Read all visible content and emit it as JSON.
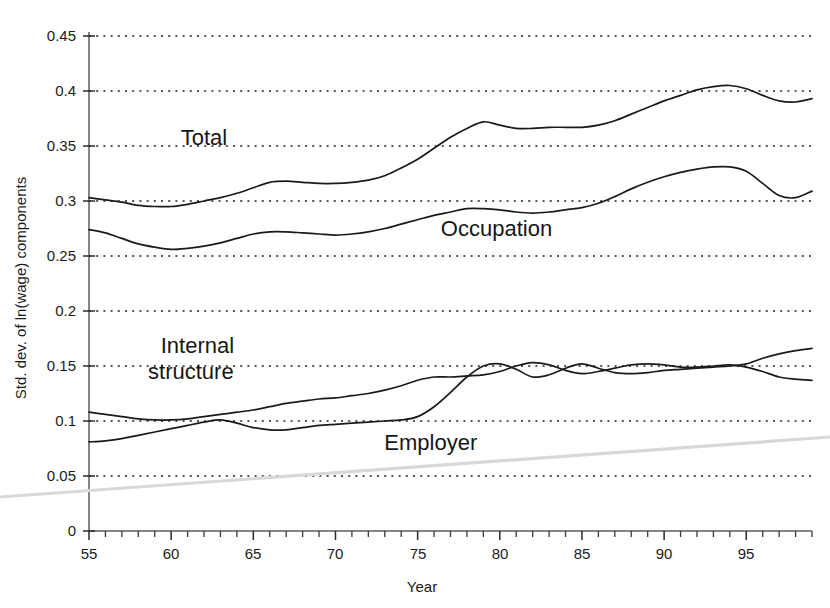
{
  "chart_data": {
    "type": "line",
    "title": "",
    "xlabel": "Year",
    "ylabel": "Std. dev. of ln(wage) components",
    "xlim": [
      55,
      99
    ],
    "ylim": [
      0,
      0.45
    ],
    "grid": true,
    "legend_position": "inline-annotations",
    "y_ticks": [
      "0",
      "0.05",
      "0.1",
      "0.15",
      "0.2",
      "0.25",
      "0.3",
      "0.35",
      "0.4",
      "0.45"
    ],
    "y_tick_values": [
      0,
      0.05,
      0.1,
      0.15,
      0.2,
      0.25,
      0.3,
      0.35,
      0.4,
      0.45
    ],
    "x_ticks": [
      "55",
      "60",
      "65",
      "70",
      "75",
      "80",
      "85",
      "90",
      "95"
    ],
    "x_tick_values": [
      55,
      60,
      65,
      70,
      75,
      80,
      85,
      90,
      95
    ],
    "x": [
      55,
      56,
      57,
      58,
      59,
      60,
      61,
      62,
      63,
      64,
      65,
      66,
      67,
      68,
      69,
      70,
      71,
      72,
      73,
      74,
      75,
      76,
      77,
      78,
      79,
      80,
      81,
      82,
      83,
      84,
      85,
      86,
      87,
      88,
      89,
      90,
      91,
      92,
      93,
      94,
      95,
      96,
      97,
      98,
      99
    ],
    "series": [
      {
        "name": "Total",
        "label": "Total",
        "values": [
          0.303,
          0.301,
          0.299,
          0.296,
          0.295,
          0.295,
          0.297,
          0.3,
          0.303,
          0.307,
          0.312,
          0.317,
          0.318,
          0.317,
          0.316,
          0.316,
          0.317,
          0.319,
          0.323,
          0.33,
          0.338,
          0.348,
          0.358,
          0.366,
          0.372,
          0.369,
          0.366,
          0.366,
          0.367,
          0.367,
          0.367,
          0.369,
          0.373,
          0.379,
          0.385,
          0.391,
          0.396,
          0.401,
          0.404,
          0.405,
          0.402,
          0.396,
          0.391,
          0.39,
          0.393
        ]
      },
      {
        "name": "Occupation",
        "label": "Occupation",
        "values": [
          0.274,
          0.271,
          0.266,
          0.261,
          0.258,
          0.256,
          0.257,
          0.259,
          0.262,
          0.266,
          0.27,
          0.272,
          0.272,
          0.271,
          0.27,
          0.269,
          0.27,
          0.272,
          0.275,
          0.279,
          0.283,
          0.287,
          0.29,
          0.293,
          0.293,
          0.292,
          0.29,
          0.289,
          0.29,
          0.292,
          0.294,
          0.298,
          0.304,
          0.311,
          0.317,
          0.322,
          0.326,
          0.329,
          0.331,
          0.331,
          0.327,
          0.316,
          0.305,
          0.303,
          0.309
        ]
      },
      {
        "name": "Internal structure",
        "label": "Internal\nstructure",
        "values": [
          0.108,
          0.106,
          0.104,
          0.102,
          0.101,
          0.101,
          0.102,
          0.104,
          0.106,
          0.108,
          0.11,
          0.113,
          0.116,
          0.118,
          0.12,
          0.121,
          0.123,
          0.125,
          0.128,
          0.132,
          0.137,
          0.14,
          0.14,
          0.141,
          0.142,
          0.145,
          0.15,
          0.153,
          0.151,
          0.146,
          0.143,
          0.145,
          0.148,
          0.151,
          0.152,
          0.151,
          0.149,
          0.149,
          0.15,
          0.151,
          0.149,
          0.145,
          0.14,
          0.138,
          0.137
        ]
      },
      {
        "name": "Employer",
        "label": "Employer",
        "values": [
          0.081,
          0.082,
          0.084,
          0.087,
          0.09,
          0.093,
          0.096,
          0.099,
          0.101,
          0.098,
          0.094,
          0.092,
          0.092,
          0.094,
          0.096,
          0.097,
          0.098,
          0.099,
          0.1,
          0.101,
          0.104,
          0.113,
          0.126,
          0.14,
          0.15,
          0.152,
          0.147,
          0.14,
          0.142,
          0.148,
          0.152,
          0.148,
          0.144,
          0.143,
          0.144,
          0.146,
          0.147,
          0.148,
          0.149,
          0.15,
          0.152,
          0.157,
          0.161,
          0.164,
          0.166
        ]
      }
    ],
    "annotations": [
      {
        "name": "total-label",
        "text": "Total",
        "x": 62.0,
        "y": 0.351
      },
      {
        "name": "occupation-label",
        "text": "Occupation",
        "x": 79.8,
        "y": 0.268
      },
      {
        "name": "internal-structure-label-line1",
        "text": "Internal",
        "x": 61.6,
        "y": 0.162
      },
      {
        "name": "internal-structure-label-line2",
        "text": "structure",
        "x": 61.2,
        "y": 0.138
      },
      {
        "name": "employer-label",
        "text": "Employer",
        "x": 75.8,
        "y": 0.074
      }
    ]
  },
  "colors": {
    "line": "#1a1a1a",
    "grid": "#1d1d1d",
    "axis": "#5d5d5d",
    "text": "#1b1b1b",
    "background": "#ffffff",
    "artifact": "#d8d8d8"
  }
}
